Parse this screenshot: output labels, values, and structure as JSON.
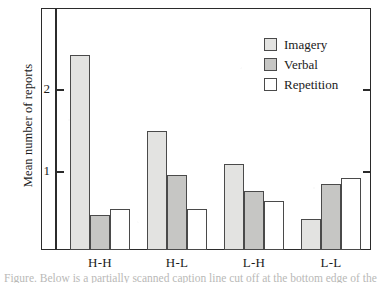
{
  "chart_data": {
    "type": "bar",
    "title": "",
    "xlabel": "",
    "ylabel": "Mean number of reports",
    "categories": [
      "H-H",
      "H-L",
      "L-H",
      "L-L"
    ],
    "series": [
      {
        "name": "Imagery",
        "color": "#e3e3e1",
        "values": [
          2.38,
          1.45,
          1.05,
          0.38
        ]
      },
      {
        "name": "Verbal",
        "color": "#c6c6c4",
        "values": [
          0.43,
          0.92,
          0.72,
          0.8
        ]
      },
      {
        "name": "Repetition",
        "color": "#ffffff",
        "values": [
          0.5,
          0.5,
          0.6,
          0.88
        ]
      }
    ],
    "ylim": [
      0,
      2.75
    ],
    "yticks": [
      1,
      2
    ],
    "ytick_labels": [
      "1",
      "2"
    ],
    "grid": false,
    "legend_position": "top-right"
  },
  "axis": {
    "y_title": "Mean number of reports",
    "tick_2": "2",
    "tick_1": "1"
  },
  "legend": {
    "items": [
      {
        "label": "Imagery"
      },
      {
        "label": "Verbal"
      },
      {
        "label": "Repetition"
      }
    ]
  },
  "xaxis": {
    "labels": [
      "H-H",
      "H-L",
      "L-H",
      "L-L"
    ]
  },
  "caption": {
    "partial_text": "Figure.  Below is a partially scanned caption line cut off at the bottom edge of the page"
  }
}
